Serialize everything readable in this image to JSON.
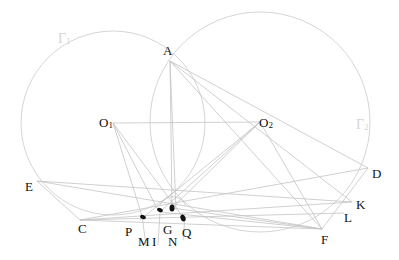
{
  "diagram": {
    "type": "geometry-two-circles",
    "circles": [
      {
        "name": "Γ1",
        "center": "O1",
        "label": "Γ1"
      },
      {
        "name": "Γ2",
        "center": "O2",
        "label": "Γ2"
      }
    ],
    "points": {
      "A": {
        "label": "A"
      },
      "O1": {
        "label": "O",
        "sub": "1"
      },
      "O2": {
        "label": "O",
        "sub": "2"
      },
      "E": {
        "label": "E"
      },
      "C": {
        "label": "C"
      },
      "D": {
        "label": "D"
      },
      "K": {
        "label": "K"
      },
      "L": {
        "label": "L"
      },
      "F": {
        "label": "F"
      },
      "P": {
        "label": "P"
      },
      "M": {
        "label": "M"
      },
      "I": {
        "label": "I"
      },
      "G": {
        "label": "G"
      },
      "N": {
        "label": "N"
      },
      "Q": {
        "label": "Q"
      }
    },
    "gamma1_label": "Γ",
    "gamma1_sub": "1",
    "gamma2_label": "Γ",
    "gamma2_sub": "2",
    "colors": {
      "line": "#c8c8c8",
      "circle": "#d0d0d0",
      "dot": "#111111",
      "text": "#111111"
    }
  }
}
